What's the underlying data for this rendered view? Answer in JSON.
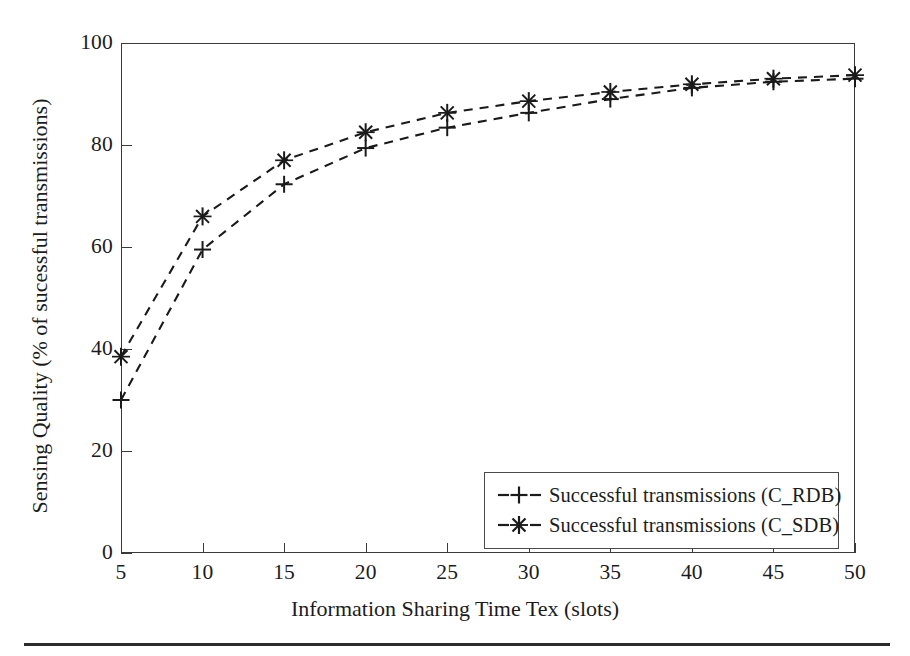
{
  "chart_data": {
    "type": "line",
    "title": "",
    "xlabel": "Information Sharing Time Tex (slots)",
    "ylabel": "Sensing Quality (% of sucessful transmissions)",
    "x": [
      5,
      10,
      15,
      20,
      25,
      30,
      35,
      40,
      45,
      50
    ],
    "xlim": [
      5,
      50
    ],
    "ylim": [
      0,
      100
    ],
    "xticks": [
      "5",
      "10",
      "15",
      "20",
      "25",
      "30",
      "35",
      "40",
      "45",
      "50"
    ],
    "yticks": [
      "0",
      "20",
      "40",
      "60",
      "80",
      "100"
    ],
    "grid": false,
    "legend_position": "lower right",
    "series": [
      {
        "name": "Successful transmissions (C_RDB)",
        "marker": "plus",
        "linestyle": "dashed",
        "color": "#1a1a1a",
        "values": [
          30.0,
          59.5,
          72.3,
          79.4,
          83.4,
          86.3,
          89.0,
          91.2,
          92.4,
          93.0
        ]
      },
      {
        "name": "Successful transmissions (C_SDB)",
        "marker": "asterisk",
        "linestyle": "dashed",
        "color": "#1a1a1a",
        "values": [
          38.5,
          66.0,
          77.0,
          82.5,
          86.3,
          88.6,
          90.4,
          91.9,
          93.0,
          93.7
        ]
      }
    ]
  },
  "legend": {
    "items": [
      {
        "label": "Successful transmissions (C_RDB)",
        "marker": "plus"
      },
      {
        "label": "Successful transmissions (C_SDB)",
        "marker": "asterisk"
      }
    ]
  }
}
